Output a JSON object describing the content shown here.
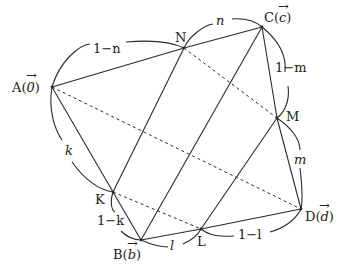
{
  "diagram": {
    "type": "quadrilateral-vector-figure",
    "points": [
      {
        "id": "A",
        "label": "A",
        "vector": "0"
      },
      {
        "id": "B",
        "label": "B",
        "vector": "b"
      },
      {
        "id": "C",
        "label": "C",
        "vector": "c"
      },
      {
        "id": "D",
        "label": "D",
        "vector": "d"
      },
      {
        "id": "K",
        "label": "K"
      },
      {
        "id": "L",
        "label": "L"
      },
      {
        "id": "M",
        "label": "M"
      },
      {
        "id": "N",
        "label": "N"
      }
    ],
    "solid_segments": [
      [
        "A",
        "N"
      ],
      [
        "N",
        "C"
      ],
      [
        "C",
        "M"
      ],
      [
        "M",
        "D"
      ],
      [
        "D",
        "L"
      ],
      [
        "L",
        "B"
      ],
      [
        "B",
        "K"
      ],
      [
        "K",
        "A"
      ],
      [
        "A",
        "C"
      ],
      [
        "K",
        "N"
      ],
      [
        "B",
        "C"
      ],
      [
        "L",
        "M"
      ]
    ],
    "dashed_segments": [
      [
        "A",
        "D"
      ],
      [
        "N",
        "M"
      ],
      [
        "K",
        "L"
      ]
    ],
    "ratio_labels": {
      "AN": "1−n",
      "NC": "n",
      "CM": "1−m",
      "MD": "m",
      "AK": "k",
      "KB": "1−k",
      "BL": "l",
      "LD": "1−l"
    }
  }
}
